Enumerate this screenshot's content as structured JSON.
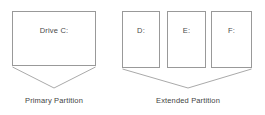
{
  "diagram": {
    "colors": {
      "background": "#ffffff",
      "box_border": "#999999",
      "bracket_line": "#aaaaaa",
      "text": "#4a4a4a"
    },
    "groups": [
      {
        "id": "primary",
        "caption": "Primary Partition",
        "boxes": [
          {
            "id": "drive-c",
            "label": "Drive C:"
          }
        ]
      },
      {
        "id": "extended",
        "caption": "Extended Partition",
        "boxes": [
          {
            "id": "drive-d",
            "label": "D:"
          },
          {
            "id": "drive-e",
            "label": "E:"
          },
          {
            "id": "drive-f",
            "label": "F:"
          }
        ]
      }
    ]
  }
}
